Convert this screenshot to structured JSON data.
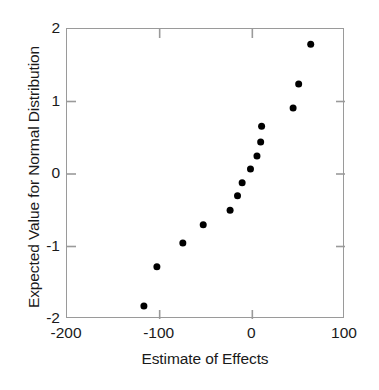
{
  "chart_data": {
    "type": "scatter",
    "title": "",
    "xlabel": "Estimate of Effects",
    "ylabel": "Expected Value for Normal Distribution",
    "xlim": [
      -200,
      100
    ],
    "ylim": [
      -2,
      2
    ],
    "xticks": [
      -200,
      -100,
      0,
      100
    ],
    "xtick_labels": [
      "-200",
      "-100",
      "0",
      "100"
    ],
    "yticks": [
      -2,
      -1,
      0,
      1,
      2
    ],
    "ytick_labels": [
      "-2",
      "-1",
      "0",
      "1",
      "2"
    ],
    "grid": false,
    "legend": null,
    "marker": {
      "shape": "circle",
      "color": "#000000",
      "size_px": 7
    },
    "series": [
      {
        "name": "Effects",
        "x": [
          -117,
          -103,
          -75,
          -53,
          -24,
          -16,
          -11,
          -2,
          5,
          9,
          10,
          44,
          50,
          63
        ],
        "y": [
          -1.82,
          -1.28,
          -0.95,
          -0.7,
          -0.5,
          -0.3,
          -0.12,
          0.07,
          0.25,
          0.44,
          0.66,
          0.91,
          1.24,
          1.79
        ]
      }
    ],
    "points": [
      {
        "x": -117,
        "y": -1.82
      },
      {
        "x": -103,
        "y": -1.28
      },
      {
        "x": -75,
        "y": -0.95
      },
      {
        "x": -53,
        "y": -0.7
      },
      {
        "x": -24,
        "y": -0.5
      },
      {
        "x": -16,
        "y": -0.3
      },
      {
        "x": -11,
        "y": -0.12
      },
      {
        "x": -2,
        "y": 0.07
      },
      {
        "x": 5,
        "y": 0.25
      },
      {
        "x": 9,
        "y": 0.44
      },
      {
        "x": 10,
        "y": 0.66
      },
      {
        "x": 44,
        "y": 0.91
      },
      {
        "x": 50,
        "y": 1.24
      },
      {
        "x": 63,
        "y": 1.79
      }
    ],
    "colors": {
      "marker": "#000000",
      "axis": "#9a9a9a",
      "text": "#1a1a1a",
      "background": "#ffffff"
    }
  },
  "axes": {
    "x_title": "Estimate of Effects",
    "y_title": "Expected Value for Normal Distribution"
  }
}
